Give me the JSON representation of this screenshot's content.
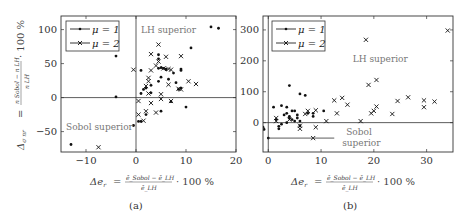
{
  "chart_data": [
    {
      "type": "scatter",
      "panel": "(a)",
      "caption": "(a)",
      "xlabel": "Δe_r = (ē_Sobol − ē_LH) / ē_LH · 100 %",
      "xlabel_parts": {
        "lhs": "Δe",
        "sub": "r",
        "eq": "=",
        "num": "ē_Sobol − ē_LH",
        "den": "ē_LH",
        "tail": "· 100 %"
      },
      "ylabel": "Δ_σnr = (nSobol − nLH) / nLH · 100 %",
      "ylabel_parts": {
        "lhs": "Δ",
        "sub": "σ nr",
        "eq": "=",
        "num": "n Sobol − n LH",
        "den": "n LH",
        "tail": "· 100 %"
      },
      "xlim": [
        -15,
        20
      ],
      "ylim": [
        -80,
        120
      ],
      "xticks": [
        -10,
        0,
        10,
        20
      ],
      "yticks": [
        -50,
        0,
        50,
        100
      ],
      "grid": false,
      "legend": {
        "position": "top-left",
        "entries": [
          "μ = 1",
          "μ = 2"
        ]
      },
      "annotations": [
        {
          "text": "LH superior",
          "x": 1,
          "y": 95
        },
        {
          "text": "Sobol superior",
          "x": -14,
          "y": -47
        }
      ],
      "reference_lines": {
        "x": 0,
        "y": 0
      },
      "series": [
        {
          "name": "μ = 1",
          "marker": "dot",
          "points": [
            [
              -4,
              61
            ],
            [
              -4,
              1
            ],
            [
              -13,
              -69
            ],
            [
              -0.5,
              -41
            ],
            [
              1,
              40
            ],
            [
              4.5,
              63
            ],
            [
              4.5,
              57
            ],
            [
              4.5,
              43
            ],
            [
              5,
              44
            ],
            [
              5.5,
              43
            ],
            [
              6,
              41
            ],
            [
              7.5,
              36
            ],
            [
              9,
              42
            ],
            [
              9,
              40
            ],
            [
              11,
              73
            ],
            [
              15,
              104
            ],
            [
              16.5,
              102
            ],
            [
              8,
              22
            ],
            [
              5,
              30
            ],
            [
              6.5,
              27
            ],
            [
              3,
              18
            ],
            [
              2,
              14
            ],
            [
              1.5,
              12
            ],
            [
              1,
              6
            ],
            [
              0.5,
              -35
            ],
            [
              1,
              -35
            ],
            [
              2,
              -25
            ],
            [
              5,
              -20
            ],
            [
              10,
              -14
            ],
            [
              7,
              -6
            ],
            [
              8.5,
              12
            ],
            [
              9,
              14
            ],
            [
              3,
              7
            ],
            [
              4.5,
              24
            ],
            [
              6,
              42
            ]
          ]
        },
        {
          "name": "μ = 2",
          "marker": "cross",
          "points": [
            [
              -0.5,
              41
            ],
            [
              4.5,
              78
            ],
            [
              3,
              64
            ],
            [
              6,
              60
            ],
            [
              9,
              61
            ],
            [
              3,
              40
            ],
            [
              4,
              47
            ],
            [
              4.5,
              53
            ],
            [
              5.5,
              43
            ],
            [
              6.5,
              42
            ],
            [
              7,
              41
            ],
            [
              2.5,
              29
            ],
            [
              2.5,
              24
            ],
            [
              2,
              17
            ],
            [
              2.5,
              6
            ],
            [
              5,
              5
            ],
            [
              6.5,
              19
            ],
            [
              8.5,
              13
            ],
            [
              9,
              12
            ],
            [
              10.5,
              24
            ],
            [
              12,
              20
            ],
            [
              0.5,
              -5
            ],
            [
              3,
              -8
            ],
            [
              5,
              -2
            ],
            [
              7,
              -5
            ],
            [
              0.5,
              -25
            ],
            [
              2,
              -20
            ],
            [
              4,
              -22
            ],
            [
              1.5,
              -34
            ],
            [
              -7.5,
              -73
            ]
          ]
        }
      ]
    },
    {
      "type": "scatter",
      "panel": "(b)",
      "caption": "(b)",
      "xlabel": "Δe_r = (ē_Sobol − ē_LH) / ē_LH · 100 %",
      "xlabel_parts": {
        "lhs": "Δe",
        "sub": "r",
        "eq": "=",
        "num": "ē_Sobol − ē_LH",
        "den": "ē_LH",
        "tail": "· 100 %"
      },
      "xlim": [
        -1,
        35
      ],
      "ylim": [
        -95,
        345
      ],
      "xticks": [
        0,
        10,
        20,
        30
      ],
      "yticks": [
        0,
        100,
        200,
        300
      ],
      "grid": false,
      "legend": {
        "position": "top-left",
        "entries": [
          "μ = 1",
          "μ = 2"
        ]
      },
      "annotations": [
        {
          "text": "LH superior",
          "x": 16,
          "y": 195
        },
        {
          "text": "Sobol superior",
          "x": 14,
          "y": -45
        }
      ],
      "reference_lines": {
        "x": 0,
        "y": 0
      },
      "series": [
        {
          "name": "μ = 1",
          "marker": "dot",
          "points": [
            [
              -1,
              -15
            ],
            [
              -0.8,
              -22
            ],
            [
              0,
              -50
            ],
            [
              1,
              50
            ],
            [
              2.5,
              55
            ],
            [
              4,
              120
            ],
            [
              6,
              93
            ],
            [
              7,
              88
            ],
            [
              3.5,
              50
            ],
            [
              4.5,
              38
            ],
            [
              5,
              38
            ],
            [
              3,
              25
            ],
            [
              4,
              15
            ],
            [
              4.5,
              10
            ],
            [
              5,
              5
            ],
            [
              3.5,
              0
            ],
            [
              2.5,
              -5
            ],
            [
              2,
              -12
            ],
            [
              2,
              -20
            ],
            [
              5.5,
              15
            ],
            [
              6,
              5
            ],
            [
              6,
              -10
            ],
            [
              8.5,
              20
            ],
            [
              8.5,
              30
            ],
            [
              10.5,
              38
            ],
            [
              7.5,
              30
            ],
            [
              3.5,
              30
            ],
            [
              5.5,
              25
            ],
            [
              1.5,
              10
            ],
            [
              4,
              20
            ]
          ]
        },
        {
          "name": "μ = 2",
          "marker": "cross",
          "points": [
            [
              1.5,
              15
            ],
            [
              1.5,
              5
            ],
            [
              4,
              10
            ],
            [
              6,
              -10
            ],
            [
              6,
              -20
            ],
            [
              7.5,
              38
            ],
            [
              9,
              40
            ],
            [
              9,
              -15
            ],
            [
              8.5,
              -50
            ],
            [
              11,
              5
            ],
            [
              12.5,
              72
            ],
            [
              13,
              30
            ],
            [
              14,
              80
            ],
            [
              15,
              58
            ],
            [
              17.5,
              5
            ],
            [
              18.5,
              268
            ],
            [
              19,
              122
            ],
            [
              19.5,
              30
            ],
            [
              20,
              38
            ],
            [
              20.5,
              52
            ],
            [
              20.5,
              138
            ],
            [
              23.5,
              28
            ],
            [
              24.5,
              70
            ],
            [
              26.5,
              82
            ],
            [
              29.5,
              72
            ],
            [
              29.5,
              50
            ],
            [
              31.5,
              68
            ],
            [
              34,
              298
            ],
            [
              7,
              28
            ]
          ]
        }
      ]
    }
  ]
}
